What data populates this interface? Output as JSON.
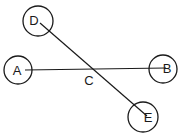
{
  "diagram": {
    "nodes": [
      {
        "id": "D",
        "label": "D",
        "cx": 38,
        "cy": 21,
        "r": 15,
        "lx": 34,
        "ly": 20
      },
      {
        "id": "A",
        "label": "A",
        "cx": 18,
        "cy": 70,
        "r": 14,
        "lx": 17,
        "ly": 70
      },
      {
        "id": "B",
        "label": "B",
        "cx": 163,
        "cy": 69,
        "r": 14,
        "lx": 167,
        "ly": 68
      },
      {
        "id": "E",
        "label": "E",
        "cx": 143,
        "cy": 117,
        "r": 15,
        "lx": 148,
        "ly": 117
      }
    ],
    "edges": [
      {
        "from": "A",
        "to": "B",
        "x1": 25,
        "y1": 70,
        "x2": 166,
        "y2": 68
      },
      {
        "from": "D",
        "to": "E",
        "x1": 40,
        "y1": 23,
        "x2": 147,
        "y2": 116
      }
    ],
    "intersection": {
      "label": "C",
      "lx": 89,
      "ly": 80
    }
  }
}
